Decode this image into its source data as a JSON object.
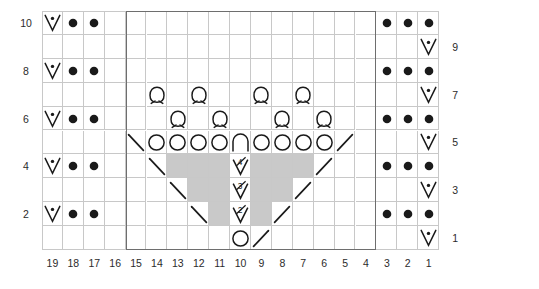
{
  "chart_data": {
    "type": "table",
    "title": "",
    "columns": 19,
    "rows": 10,
    "column_labels": [
      "19",
      "18",
      "17",
      "16",
      "15",
      "14",
      "13",
      "12",
      "11",
      "10",
      "9",
      "8",
      "7",
      "6",
      "5",
      "4",
      "3",
      "2",
      "1"
    ],
    "row_labels_left": [
      "10",
      "8",
      "6",
      "4",
      "2"
    ],
    "row_labels_right": [
      "9",
      "7",
      "5",
      "3",
      "1"
    ],
    "repeat_box": {
      "from_column": 15,
      "to_column": 4,
      "from_row": 1,
      "to_row": 10
    },
    "symbol_legend": {
      "v-dot": "slip stitch / purl-tbl V with dot",
      "dot": "purl stitch",
      "omega": "yarn over loop (omega)",
      "circle": "yarn over",
      "arch": "arch / centered double decrease cap",
      "slash-left": "left-leaning decrease (backslash)",
      "slash-right": "right-leaning decrease (forward slash)",
      "v-num": "numbered V stitch",
      "nostitch": "no stitch (grey block)"
    },
    "cells": [
      {
        "row": 10,
        "col": 19,
        "symbol": "v-dot"
      },
      {
        "row": 10,
        "col": 18,
        "symbol": "dot"
      },
      {
        "row": 10,
        "col": 17,
        "symbol": "dot"
      },
      {
        "row": 10,
        "col": 3,
        "symbol": "dot"
      },
      {
        "row": 10,
        "col": 2,
        "symbol": "dot"
      },
      {
        "row": 10,
        "col": 1,
        "symbol": "dot"
      },
      {
        "row": 9,
        "col": 1,
        "symbol": "v-dot"
      },
      {
        "row": 8,
        "col": 19,
        "symbol": "v-dot"
      },
      {
        "row": 8,
        "col": 18,
        "symbol": "dot"
      },
      {
        "row": 8,
        "col": 17,
        "symbol": "dot"
      },
      {
        "row": 8,
        "col": 3,
        "symbol": "dot"
      },
      {
        "row": 8,
        "col": 2,
        "symbol": "dot"
      },
      {
        "row": 8,
        "col": 1,
        "symbol": "dot"
      },
      {
        "row": 7,
        "col": 14,
        "symbol": "omega"
      },
      {
        "row": 7,
        "col": 12,
        "symbol": "omega"
      },
      {
        "row": 7,
        "col": 9,
        "symbol": "omega"
      },
      {
        "row": 7,
        "col": 7,
        "symbol": "omega"
      },
      {
        "row": 7,
        "col": 1,
        "symbol": "v-dot"
      },
      {
        "row": 6,
        "col": 19,
        "symbol": "v-dot"
      },
      {
        "row": 6,
        "col": 18,
        "symbol": "dot"
      },
      {
        "row": 6,
        "col": 17,
        "symbol": "dot"
      },
      {
        "row": 6,
        "col": 13,
        "symbol": "omega"
      },
      {
        "row": 6,
        "col": 11,
        "symbol": "omega"
      },
      {
        "row": 6,
        "col": 8,
        "symbol": "omega"
      },
      {
        "row": 6,
        "col": 6,
        "symbol": "omega"
      },
      {
        "row": 6,
        "col": 3,
        "symbol": "dot"
      },
      {
        "row": 6,
        "col": 2,
        "symbol": "dot"
      },
      {
        "row": 6,
        "col": 1,
        "symbol": "dot"
      },
      {
        "row": 5,
        "col": 15,
        "symbol": "slash-left"
      },
      {
        "row": 5,
        "col": 14,
        "symbol": "circle"
      },
      {
        "row": 5,
        "col": 13,
        "symbol": "circle"
      },
      {
        "row": 5,
        "col": 12,
        "symbol": "circle"
      },
      {
        "row": 5,
        "col": 11,
        "symbol": "circle"
      },
      {
        "row": 5,
        "col": 10,
        "symbol": "arch"
      },
      {
        "row": 5,
        "col": 9,
        "symbol": "circle"
      },
      {
        "row": 5,
        "col": 8,
        "symbol": "circle"
      },
      {
        "row": 5,
        "col": 7,
        "symbol": "circle"
      },
      {
        "row": 5,
        "col": 6,
        "symbol": "circle"
      },
      {
        "row": 5,
        "col": 5,
        "symbol": "slash-right"
      },
      {
        "row": 5,
        "col": 1,
        "symbol": "v-dot"
      },
      {
        "row": 4,
        "col": 19,
        "symbol": "v-dot"
      },
      {
        "row": 4,
        "col": 18,
        "symbol": "dot"
      },
      {
        "row": 4,
        "col": 17,
        "symbol": "dot"
      },
      {
        "row": 4,
        "col": 14,
        "symbol": "slash-left"
      },
      {
        "row": 4,
        "col": 13,
        "symbol": "nostitch"
      },
      {
        "row": 4,
        "col": 12,
        "symbol": "nostitch"
      },
      {
        "row": 4,
        "col": 11,
        "symbol": "nostitch"
      },
      {
        "row": 4,
        "col": 10,
        "symbol": "v-num",
        "number": "4"
      },
      {
        "row": 4,
        "col": 9,
        "symbol": "nostitch"
      },
      {
        "row": 4,
        "col": 8,
        "symbol": "nostitch"
      },
      {
        "row": 4,
        "col": 7,
        "symbol": "nostitch"
      },
      {
        "row": 4,
        "col": 6,
        "symbol": "slash-right"
      },
      {
        "row": 4,
        "col": 3,
        "symbol": "dot"
      },
      {
        "row": 4,
        "col": 2,
        "symbol": "dot"
      },
      {
        "row": 4,
        "col": 1,
        "symbol": "dot"
      },
      {
        "row": 3,
        "col": 13,
        "symbol": "slash-left"
      },
      {
        "row": 3,
        "col": 12,
        "symbol": "nostitch"
      },
      {
        "row": 3,
        "col": 11,
        "symbol": "nostitch"
      },
      {
        "row": 3,
        "col": 10,
        "symbol": "v-num",
        "number": "3"
      },
      {
        "row": 3,
        "col": 9,
        "symbol": "nostitch"
      },
      {
        "row": 3,
        "col": 8,
        "symbol": "nostitch"
      },
      {
        "row": 3,
        "col": 7,
        "symbol": "slash-right"
      },
      {
        "row": 3,
        "col": 1,
        "symbol": "v-dot"
      },
      {
        "row": 2,
        "col": 19,
        "symbol": "v-dot"
      },
      {
        "row": 2,
        "col": 18,
        "symbol": "dot"
      },
      {
        "row": 2,
        "col": 17,
        "symbol": "dot"
      },
      {
        "row": 2,
        "col": 12,
        "symbol": "slash-left"
      },
      {
        "row": 2,
        "col": 11,
        "symbol": "nostitch"
      },
      {
        "row": 2,
        "col": 10,
        "symbol": "v-num",
        "number": "2"
      },
      {
        "row": 2,
        "col": 9,
        "symbol": "nostitch"
      },
      {
        "row": 2,
        "col": 8,
        "symbol": "slash-right"
      },
      {
        "row": 2,
        "col": 3,
        "symbol": "dot"
      },
      {
        "row": 2,
        "col": 2,
        "symbol": "dot"
      },
      {
        "row": 2,
        "col": 1,
        "symbol": "dot"
      },
      {
        "row": 1,
        "col": 10,
        "symbol": "circle"
      },
      {
        "row": 1,
        "col": 9,
        "symbol": "slash-right"
      },
      {
        "row": 1,
        "col": 1,
        "symbol": "v-dot"
      }
    ]
  },
  "colors": {
    "grid_line": "#c8c8c8",
    "repeat_border": "#6e6e6e",
    "nostitch_fill": "#c9c9c9",
    "symbol": "#1a1a1a",
    "label_text": "#2b2b2b",
    "background": "#ffffff"
  }
}
